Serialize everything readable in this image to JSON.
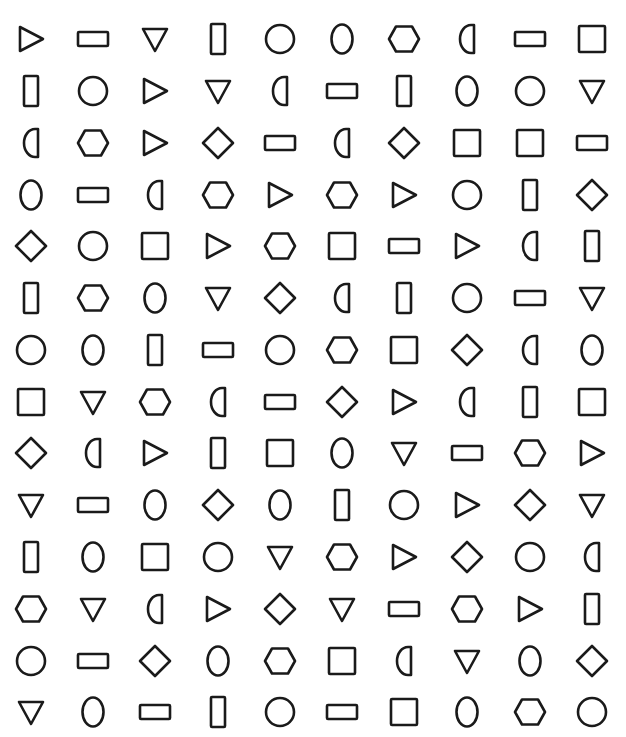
{
  "figure": {
    "columns": 10,
    "rows_count": 14,
    "column_centers_x": [
      31,
      93,
      155,
      218,
      280,
      342,
      404,
      467,
      530,
      592
    ],
    "row_centers_y": [
      39,
      91,
      143,
      195,
      246,
      298,
      350,
      402,
      453,
      505,
      557,
      609,
      661,
      712
    ],
    "stroke_color": "#1a1a1a",
    "background_color": "#ffffff",
    "shape_legend": {
      "tri-right": "triangle pointing right",
      "tri-down": "triangle pointing down",
      "rect-h": "horizontal rectangle",
      "rect-v": "vertical rectangle",
      "square": "square",
      "circle": "circle",
      "oval": "vertical oval",
      "hexagon": "hexagon",
      "half-d": "half circle (D shape, flat right side)",
      "diamond": "diamond"
    },
    "rows": [
      [
        "tri-right",
        "rect-h",
        "tri-down",
        "rect-v",
        "circle",
        "oval",
        "hexagon",
        "half-d",
        "rect-h",
        "square"
      ],
      [
        "rect-v",
        "circle",
        "tri-right",
        "tri-down",
        "half-d",
        "rect-h",
        "rect-v",
        "oval",
        "circle",
        "tri-down"
      ],
      [
        "half-d",
        "hexagon",
        "tri-right",
        "diamond",
        "rect-h",
        "half-d",
        "diamond",
        "square",
        "square",
        "rect-h"
      ],
      [
        "oval",
        "rect-h",
        "half-d",
        "hexagon",
        "tri-right",
        "hexagon",
        "tri-right",
        "circle",
        "rect-v",
        "diamond"
      ],
      [
        "diamond",
        "circle",
        "square",
        "tri-right",
        "hexagon",
        "square",
        "rect-h",
        "tri-right",
        "half-d",
        "rect-v"
      ],
      [
        "rect-v",
        "hexagon",
        "oval",
        "tri-down",
        "diamond",
        "half-d",
        "rect-v",
        "circle",
        "rect-h",
        "tri-down"
      ],
      [
        "circle",
        "oval",
        "rect-v",
        "rect-h",
        "circle",
        "hexagon",
        "square",
        "diamond",
        "half-d",
        "oval"
      ],
      [
        "square",
        "tri-down",
        "hexagon",
        "half-d",
        "rect-h",
        "diamond",
        "tri-right",
        "half-d",
        "rect-v",
        "square"
      ],
      [
        "diamond",
        "half-d",
        "tri-right",
        "rect-v",
        "square",
        "oval",
        "tri-down",
        "rect-h",
        "hexagon",
        "tri-right"
      ],
      [
        "tri-down",
        "rect-h",
        "oval",
        "diamond",
        "oval",
        "rect-v",
        "circle",
        "tri-right",
        "diamond",
        "tri-down"
      ],
      [
        "rect-v",
        "oval",
        "square",
        "circle",
        "tri-down",
        "hexagon",
        "tri-right",
        "diamond",
        "circle",
        "half-d"
      ],
      [
        "hexagon",
        "tri-down",
        "half-d",
        "tri-right",
        "diamond",
        "tri-down",
        "rect-h",
        "hexagon",
        "tri-right",
        "rect-v"
      ],
      [
        "circle",
        "rect-h",
        "diamond",
        "oval",
        "hexagon",
        "square",
        "half-d",
        "tri-down",
        "oval",
        "diamond"
      ],
      [
        "tri-down",
        "oval",
        "rect-h",
        "rect-v",
        "circle",
        "rect-h",
        "square",
        "oval",
        "hexagon",
        "circle"
      ]
    ]
  }
}
